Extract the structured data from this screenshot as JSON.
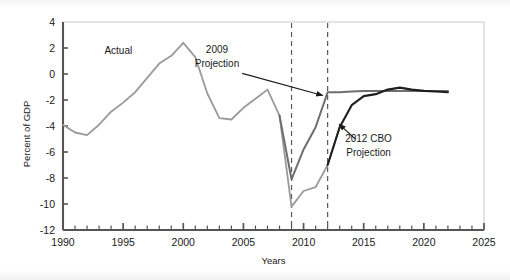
{
  "chart_data": {
    "type": "line",
    "title": "",
    "xlabel": "Years",
    "ylabel": "Percent of GDP",
    "xlim": [
      1990,
      2025
    ],
    "ylim": [
      -12,
      4
    ],
    "xticks": [
      1990,
      1995,
      2000,
      2005,
      2010,
      2015,
      2020,
      2025
    ],
    "xtick_labels": [
      "1990",
      "1995",
      "2000",
      "2005",
      "2010",
      "2015",
      "2020",
      "2025"
    ],
    "yticks": [
      4,
      2,
      0,
      -2,
      -4,
      -6,
      -8,
      -10,
      -12
    ],
    "ytick_labels": [
      "4",
      "2",
      "0",
      "-2",
      "-4",
      "-6",
      "-8",
      "-10",
      "-12"
    ],
    "minor_xtick_interval": 1,
    "grid": false,
    "legend": "none",
    "annotations": [
      {
        "text": "Actual",
        "x": 1994.6,
        "y": 1.55,
        "arrow": false
      },
      {
        "text": "2009",
        "x": 2002.8,
        "y": 1.6,
        "arrow": true
      },
      {
        "text": "Projection",
        "x": 2002.8,
        "y": 0.55,
        "arrow": true
      },
      {
        "text": "2012 CBO",
        "x": 2015.4,
        "y": -5.2,
        "arrow": true
      },
      {
        "text": "Projection",
        "x": 2015.4,
        "y": -6.3,
        "arrow": true
      }
    ],
    "vlines": [
      {
        "x": 2009,
        "style": "dashed"
      },
      {
        "x": 2012,
        "style": "dashed"
      }
    ],
    "series": [
      {
        "name": "Actual",
        "color": "#9a9a9a",
        "width": 1.8,
        "x": [
          1990,
          1991,
          1992,
          1993,
          1994,
          1995,
          1996,
          1997,
          1998,
          1999,
          2000,
          2001,
          2002,
          2003,
          2004,
          2005,
          2006,
          2007,
          2008,
          2009,
          2010,
          2011,
          2012,
          2013
        ],
        "y": [
          -3.9,
          -4.5,
          -4.7,
          -3.9,
          -2.9,
          -2.2,
          -1.4,
          -0.3,
          0.8,
          1.4,
          2.4,
          1.3,
          -1.5,
          -3.4,
          -3.5,
          -2.6,
          -1.9,
          -1.2,
          -3.2,
          -10.2,
          -9.0,
          -8.7,
          -7.0,
          -4.1
        ],
        "note": "Light-gray historical deficit/surplus path continuing into actual 2010-2013 outcomes"
      },
      {
        "name": "2009 Projection",
        "color": "#6e6e6e",
        "width": 2.0,
        "x": [
          2008,
          2009,
          2010,
          2011,
          2012,
          2013,
          2014,
          2015,
          2016,
          2017,
          2018,
          2019,
          2020,
          2021,
          2022
        ],
        "y": [
          -3.2,
          -8.1,
          -5.8,
          -4.1,
          -1.4,
          -1.4,
          -1.35,
          -1.3,
          -1.3,
          -1.3,
          -1.3,
          -1.3,
          -1.3,
          -1.3,
          -1.3
        ],
        "note": "Medium-gray projection made in 2009"
      },
      {
        "name": "2012 CBO Projection",
        "color": "#1f1f1f",
        "width": 2.1,
        "x": [
          2012,
          2013,
          2014,
          2015,
          2016,
          2017,
          2018,
          2019,
          2020,
          2021,
          2022
        ],
        "y": [
          -7.0,
          -4.1,
          -2.4,
          -1.7,
          -1.55,
          -1.2,
          -1.05,
          -1.2,
          -1.3,
          -1.35,
          -1.4
        ],
        "note": "Dark-black CBO projection made in 2012"
      }
    ]
  }
}
